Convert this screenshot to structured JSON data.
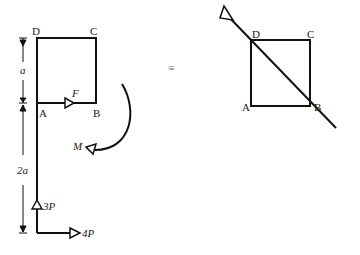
{
  "left_figure": {
    "vertices": {
      "D": "D",
      "C": "C",
      "A": "A",
      "B": "B"
    },
    "dimensions": {
      "top": "a",
      "bottom": "2a"
    },
    "forces": {
      "F": "F",
      "M": "M",
      "P3": "3P",
      "P4": "4P"
    }
  },
  "equivalence_symbol": "≡",
  "right_figure": {
    "vertices": {
      "D": "D",
      "C": "C",
      "A": "A",
      "B": "B"
    }
  }
}
